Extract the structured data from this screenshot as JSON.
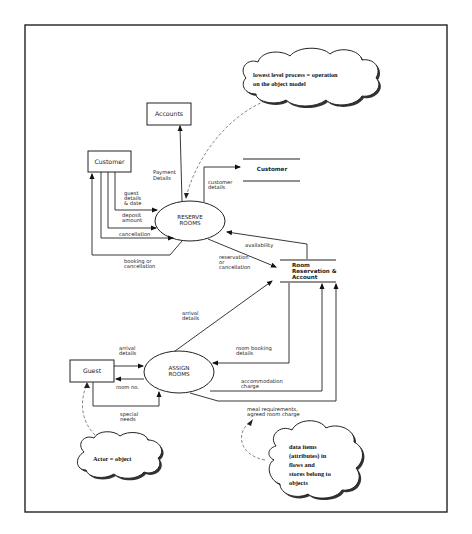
{
  "diagram": {
    "type": "data flow diagram",
    "entities": {
      "customer": "Customer",
      "accounts": "Accounts",
      "guest": "Guest"
    },
    "processes": {
      "reserve": [
        "RESERVE",
        "ROOMS"
      ],
      "assign": [
        "ASSIGN",
        "ROOMS"
      ]
    },
    "stores": {
      "customer": "Customer",
      "room": [
        "Room",
        "Reservation &",
        "Account"
      ]
    },
    "flows": {
      "payment_details": [
        "Payment",
        "Details"
      ],
      "customer_details": [
        "customer",
        "details"
      ],
      "guest_details": [
        "guest",
        "details",
        "& date"
      ],
      "deposit_amount": [
        "deposit",
        "amount"
      ],
      "cancellation": "cancellation",
      "booking_or_cancellation": [
        "booking or",
        "cancellation"
      ],
      "availability": "availability",
      "reservation_or_cancellation": [
        "reservation",
        "or",
        "cancellation"
      ],
      "arrival_details_store": [
        "arrival",
        "details"
      ],
      "arrival_details_guest": [
        "arrival",
        "details"
      ],
      "room_booking_details": [
        "room booking",
        "details"
      ],
      "room_no": "room no.",
      "accommodation_charge": [
        "accommodation",
        "charge"
      ],
      "special_needs": [
        "special",
        "needs"
      ],
      "meal_requirements": [
        "meal requirements,",
        "agreed room charge"
      ]
    },
    "annotations": {
      "process_note": [
        "lowest level process = operation",
        "on the object model"
      ],
      "actor_note": "Actor = object",
      "data_note": [
        "data items",
        "(attributes) in",
        "flows and",
        "stores belong to",
        "objects"
      ]
    }
  }
}
